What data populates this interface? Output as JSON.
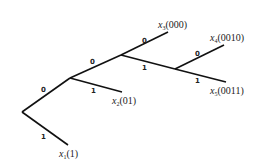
{
  "diagram": {
    "type": "binary-code-tree",
    "edges": [
      {
        "from": "root",
        "to": "n0",
        "label": "0"
      },
      {
        "from": "root",
        "to": "x1",
        "label": "1"
      },
      {
        "from": "n0",
        "to": "n00",
        "label": "0"
      },
      {
        "from": "n0",
        "to": "x2",
        "label": "1"
      },
      {
        "from": "n00",
        "to": "x3",
        "label": "0"
      },
      {
        "from": "n00",
        "to": "n001",
        "label": "1"
      },
      {
        "from": "n001",
        "to": "x4",
        "label": "0"
      },
      {
        "from": "n001",
        "to": "x5",
        "label": "1"
      }
    ],
    "leaves": [
      {
        "var": "x",
        "sub": "1",
        "code": "(1)"
      },
      {
        "var": "x",
        "sub": "2",
        "code": "(01)"
      },
      {
        "var": "x",
        "sub": "3",
        "code": "(000)"
      },
      {
        "var": "x",
        "sub": "4",
        "code": "(0010)"
      },
      {
        "var": "x",
        "sub": "5",
        "code": "(0011)"
      }
    ]
  }
}
